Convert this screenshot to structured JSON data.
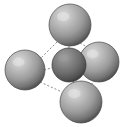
{
  "figure": {
    "name": "molecular-model",
    "background_color": "#ffffff",
    "width": 122,
    "height": 127
  },
  "style": {
    "sphere_light_highlight": "#d8d8d8",
    "sphere_light_mid": "#a8a8a8",
    "sphere_light_edge": "#6a6a6a",
    "sphere_light_rim": "#4a4a4a",
    "sphere_dark_highlight": "#9a9a9a",
    "sphere_dark_mid": "#7a7a7a",
    "sphere_dark_edge": "#4e4e4e",
    "sphere_dark_rim": "#3a3a3a",
    "bond_color": "#8a8a8a",
    "bond_width": 1,
    "bond_dash": "2,2"
  },
  "atoms": [
    {
      "id": "atom-top",
      "label": "top sphere",
      "cx": 70,
      "cy": 25,
      "r": 21,
      "shade": "light"
    },
    {
      "id": "atom-left",
      "label": "left sphere",
      "cx": 25,
      "cy": 70,
      "r": 20,
      "shade": "light"
    },
    {
      "id": "atom-right",
      "label": "right sphere",
      "cx": 99,
      "cy": 62,
      "r": 20,
      "shade": "light"
    },
    {
      "id": "atom-bottom",
      "label": "bottom sphere",
      "cx": 81,
      "cy": 102,
      "r": 21,
      "shade": "light"
    },
    {
      "id": "atom-center",
      "label": "center sphere",
      "cx": 69,
      "cy": 65,
      "r": 17,
      "shade": "dark"
    }
  ],
  "bonds": [
    {
      "id": "bond-top-left",
      "label": "top to left bond",
      "x1": 57,
      "y1": 42,
      "x2": 39,
      "y2": 60
    },
    {
      "id": "bond-top-center",
      "label": "top to center bond",
      "x1": 69,
      "y1": 46,
      "x2": 69,
      "y2": 53
    },
    {
      "id": "bond-top-right",
      "label": "top to right bond",
      "x1": 80,
      "y1": 43,
      "x2": 92,
      "y2": 50
    },
    {
      "id": "bond-left-center",
      "label": "left to center bond",
      "x1": 44,
      "y1": 70,
      "x2": 55,
      "y2": 67
    },
    {
      "id": "bond-left-bottom",
      "label": "left to bottom bond",
      "x1": 40,
      "y1": 82,
      "x2": 62,
      "y2": 92
    },
    {
      "id": "bond-center-bottom",
      "label": "center to bottom bond",
      "x1": 73,
      "y1": 81,
      "x2": 78,
      "y2": 88
    },
    {
      "id": "bond-right-bottom",
      "label": "right to bottom bond",
      "x1": 95,
      "y1": 80,
      "x2": 90,
      "y2": 86
    }
  ]
}
